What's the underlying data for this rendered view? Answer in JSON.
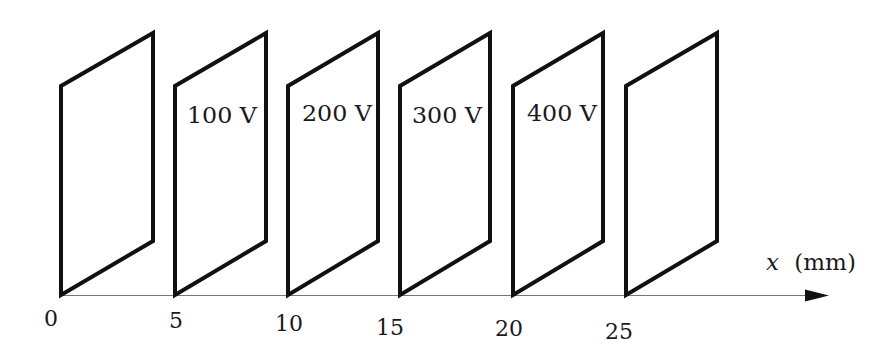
{
  "diagram": {
    "colors": {
      "plate_stroke": "#111111",
      "axis_line": "#777777",
      "text": "#1a1a1a",
      "background": "#ffffff"
    },
    "axis": {
      "variable": "x",
      "unit_label": "(mm)",
      "ticks": [
        "0",
        "5",
        "10",
        "15",
        "20",
        "25"
      ]
    },
    "plates": [
      {
        "position": "0",
        "voltage_label": ""
      },
      {
        "position": "5",
        "voltage_label": "100 V"
      },
      {
        "position": "10",
        "voltage_label": "200 V"
      },
      {
        "position": "15",
        "voltage_label": "300 V"
      },
      {
        "position": "20",
        "voltage_label": "400 V"
      },
      {
        "position": "25",
        "voltage_label": ""
      }
    ]
  }
}
